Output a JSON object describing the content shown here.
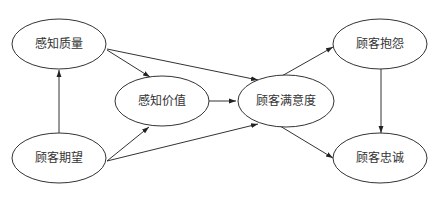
{
  "diagram": {
    "nodes": [
      {
        "id": "perceived_quality",
        "label": "感知质量",
        "cx": 59,
        "cy": 44
      },
      {
        "id": "perceived_value",
        "label": "感知价值",
        "cx": 162,
        "cy": 101
      },
      {
        "id": "customer_expectation",
        "label": "顾客期望",
        "cx": 59,
        "cy": 158
      },
      {
        "id": "customer_satisfaction",
        "label": "顾客满意度",
        "cx": 286,
        "cy": 101
      },
      {
        "id": "customer_complaint",
        "label": "顾客抱怨",
        "cx": 380,
        "cy": 44
      },
      {
        "id": "customer_loyalty",
        "label": "顾客忠诚",
        "cx": 380,
        "cy": 158
      }
    ],
    "edges": [
      {
        "from": "customer_expectation",
        "to": "perceived_quality"
      },
      {
        "from": "perceived_quality",
        "to": "perceived_value"
      },
      {
        "from": "perceived_quality",
        "to": "customer_satisfaction"
      },
      {
        "from": "customer_expectation",
        "to": "perceived_value"
      },
      {
        "from": "customer_expectation",
        "to": "customer_satisfaction"
      },
      {
        "from": "perceived_value",
        "to": "customer_satisfaction"
      },
      {
        "from": "customer_satisfaction",
        "to": "customer_complaint"
      },
      {
        "from": "customer_satisfaction",
        "to": "customer_loyalty"
      },
      {
        "from": "customer_complaint",
        "to": "customer_loyalty"
      }
    ]
  }
}
